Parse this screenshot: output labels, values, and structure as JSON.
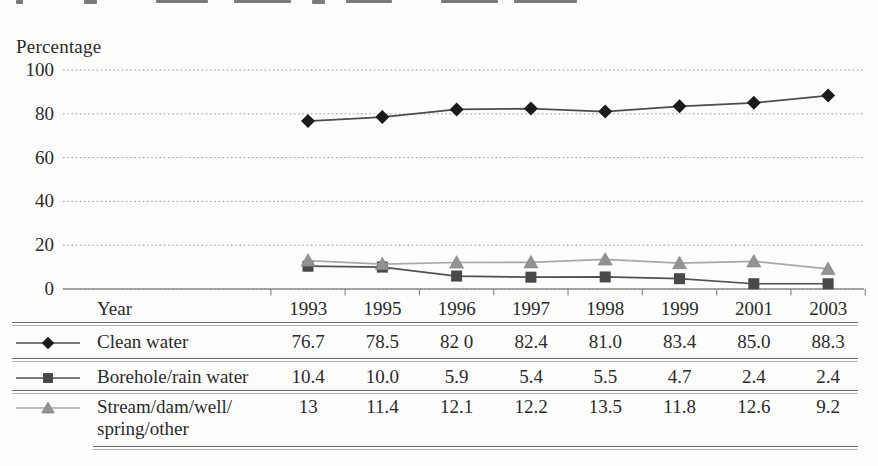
{
  "chart_data": {
    "type": "line",
    "title": "",
    "ylabel": "Percentage",
    "xlabel": "Year",
    "ylim": [
      0,
      100
    ],
    "y_ticks": [
      0,
      20,
      40,
      60,
      80,
      100
    ],
    "grid": "horizontal-dotted",
    "legend_position": "left-of-table-rows",
    "categories": [
      "1993",
      "1995",
      "1996",
      "1997",
      "1998",
      "1999",
      "2001",
      "2003"
    ],
    "series": [
      {
        "name": "Clean water",
        "marker": "diamond",
        "marker_color": "#1b1b1b",
        "line_color": "#4c4c4c",
        "values": [
          76.7,
          78.5,
          82.0,
          82.4,
          81.0,
          83.4,
          85.0,
          88.3
        ],
        "display_values": [
          "76.7",
          "78.5",
          "82 0",
          "82.4",
          "81.0",
          "83.4",
          "85.0",
          "88.3"
        ]
      },
      {
        "name": "Borehole/rain water",
        "marker": "square",
        "marker_color": "#484848",
        "line_color": "#515151",
        "values": [
          10.4,
          10.0,
          5.9,
          5.4,
          5.5,
          4.7,
          2.4,
          2.4
        ],
        "display_values": [
          "10.4",
          "10.0",
          "5.9",
          "5.4",
          "5.5",
          "4.7",
          "2.4",
          "2.4"
        ]
      },
      {
        "name": "Stream/dam/well/\nspring/other",
        "marker": "triangle",
        "marker_color": "#939393",
        "line_color": "#a8a8a8",
        "values": [
          13,
          11.4,
          12.1,
          12.2,
          13.5,
          11.8,
          12.6,
          9.2
        ],
        "display_values": [
          "13",
          "11.4",
          "12.1",
          "12.2",
          "13.5",
          "11.8",
          "12.6",
          "9.2"
        ]
      }
    ]
  },
  "table": {
    "year_header": "Year"
  }
}
